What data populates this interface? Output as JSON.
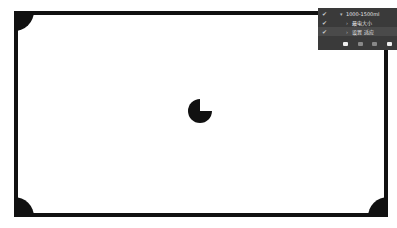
{
  "canvas": {
    "frame_color": "#111111",
    "background": "#ffffff"
  },
  "loading_indicator": {
    "type": "pie",
    "progress_percent": 75
  },
  "layers_panel": {
    "background": "#3a3a3a",
    "rows": [
      {
        "checked": true,
        "expanded": true,
        "label": "1000-1500ml"
      },
      {
        "checked": true,
        "expanded": false,
        "label": "最电大小"
      },
      {
        "checked": true,
        "expanded": false,
        "label": "设置 适应",
        "selected": true
      }
    ],
    "toolbar": [
      "fill-icon",
      "circle-icon",
      "paste-icon",
      "folder-icon"
    ]
  }
}
